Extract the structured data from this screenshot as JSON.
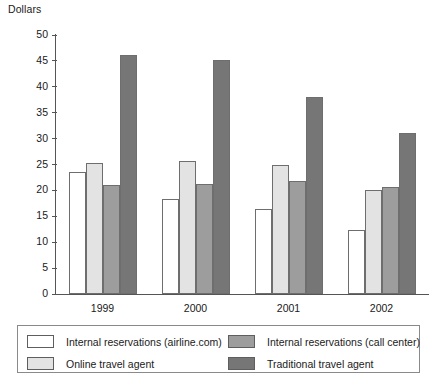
{
  "chart_data": {
    "type": "bar",
    "title": "",
    "xlabel": "",
    "ylabel": "Dollars",
    "categories": [
      "1999",
      "2000",
      "2001",
      "2002"
    ],
    "ylim": [
      0,
      50
    ],
    "yticks": [
      0,
      5,
      10,
      15,
      20,
      25,
      30,
      35,
      40,
      45,
      50
    ],
    "grid": false,
    "legend_position": "bottom",
    "series": [
      {
        "name": "Internal reservations (airline.com)",
        "color": "#ffffff",
        "values": [
          23.5,
          18.4,
          16.5,
          12.4
        ]
      },
      {
        "name": "Online travel agent",
        "color": "#e3e3e3",
        "values": [
          25.2,
          25.7,
          25.0,
          20.0
        ]
      },
      {
        "name": "Internal reservations (call center)",
        "color": "#9d9d9d",
        "values": [
          21.1,
          21.2,
          21.8,
          20.7
        ]
      },
      {
        "name": "Traditional travel agent",
        "color": "#767676",
        "values": [
          46.1,
          45.1,
          38.0,
          31.1
        ]
      }
    ]
  },
  "axis": {
    "y_title": "Dollars"
  }
}
